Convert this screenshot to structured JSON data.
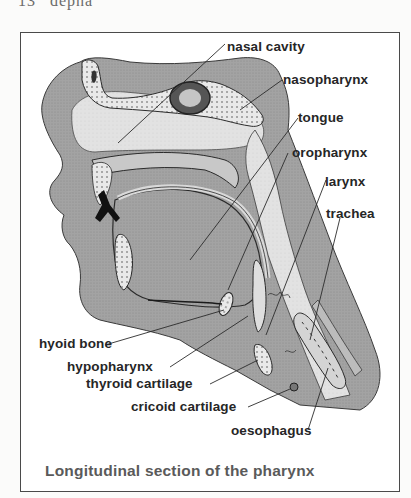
{
  "page": {
    "header_fragment": "13   depha",
    "header_number": "13",
    "header_text": "depha"
  },
  "figure": {
    "caption": "Longitudinal section of the pharynx",
    "colors": {
      "frame": "#4a4a4a",
      "tissue_dark": "#9a9a9a",
      "tissue_mid": "#b8b8b8",
      "tissue_light": "#dcdcdc",
      "airway": "#e6e6e6",
      "outline": "#2b2b2b",
      "label": "#262626",
      "caption": "#5a5a5a"
    },
    "labels": [
      {
        "id": "nasal-cavity",
        "text": "nasal cavity"
      },
      {
        "id": "nasopharynx",
        "text": "nasopharynx"
      },
      {
        "id": "tongue",
        "text": "tongue"
      },
      {
        "id": "oropharynx",
        "text": "oropharynx"
      },
      {
        "id": "larynx",
        "text": "larynx"
      },
      {
        "id": "trachea",
        "text": "trachea"
      },
      {
        "id": "hyoid-bone",
        "text": "hyoid bone"
      },
      {
        "id": "hypopharynx",
        "text": "hypopharynx"
      },
      {
        "id": "thyroid-cartilage",
        "text": "thyroid cartilage"
      },
      {
        "id": "cricoid-cartilage",
        "text": "cricoid cartilage"
      },
      {
        "id": "oesophagus",
        "text": "oesophagus"
      }
    ]
  }
}
